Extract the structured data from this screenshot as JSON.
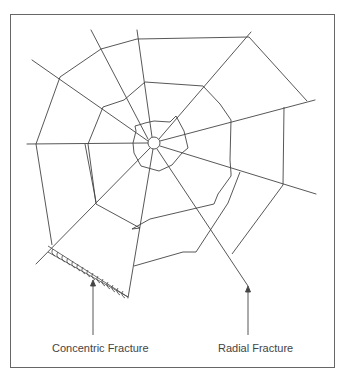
{
  "diagram": {
    "labels": {
      "concentric": "Concentric Fracture",
      "radial": "Radial Fracture"
    },
    "colors": {
      "line": "#444444",
      "border": "#666666",
      "text": "#444444"
    }
  }
}
